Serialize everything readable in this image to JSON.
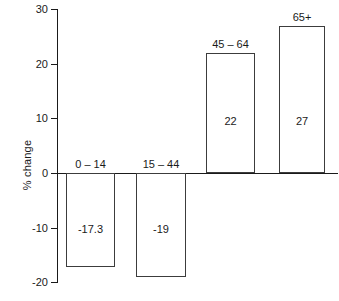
{
  "chart_data": {
    "type": "bar",
    "title": "",
    "subtitle": "",
    "xlabel": "",
    "ylabel": "% change",
    "categories": [
      "0 – 14",
      "15 – 44",
      "45 – 64",
      "65+"
    ],
    "values": [
      -17.3,
      -19,
      22,
      27
    ],
    "value_labels": [
      "-17.3",
      "-19",
      "22",
      "27"
    ],
    "ylim": [
      -20,
      30
    ],
    "yticks": [
      30,
      20,
      10,
      0,
      -10,
      -20
    ],
    "ytick_labels": [
      "30",
      "20",
      "10",
      "0",
      "-10",
      "-20"
    ],
    "grid": false,
    "legend": null,
    "orientation": "vertical",
    "bar_fill": "#ffffff",
    "bar_edge": "#3c3c3c",
    "axis_color": "#1a1a1a",
    "background": "#ffffff"
  },
  "layout": {
    "zero_y": 173,
    "px_per_unit": 5.46,
    "axis_x": 57,
    "bars_px": [
      {
        "left": 66,
        "width": 49
      },
      {
        "left": 136,
        "width": 50
      },
      {
        "left": 206,
        "width": 49
      },
      {
        "left": 279,
        "width": 46
      }
    ]
  }
}
